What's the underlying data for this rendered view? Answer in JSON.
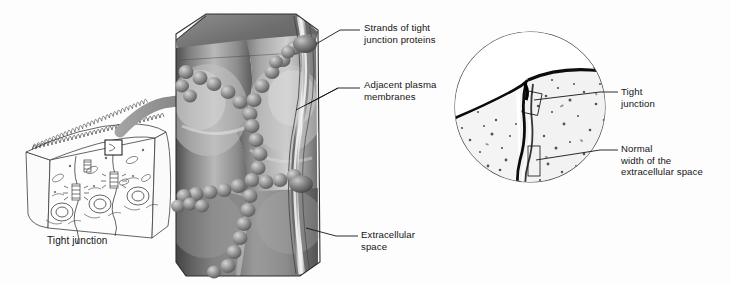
{
  "figure": {
    "background_color": "#fdfdfd",
    "ink_color": "#141414"
  },
  "panels": {
    "left_drawing": {
      "name": "epithelial-cell-line-drawing",
      "caption": "Tight junction",
      "cell_count": 3,
      "has_microvilli": true,
      "inset_box": true
    },
    "center_illustration": {
      "name": "tight-junction-3d-illustration",
      "style": "grayscale airbrush rendering",
      "strand_bead_rows": 4,
      "shade_light": "#d8d8d8",
      "shade_mid": "#9a9a9a",
      "shade_dark": "#4a4a4a"
    },
    "right_micrograph": {
      "name": "electron-micrograph",
      "shape": "circle",
      "grain": "stippled",
      "border_color": "#555555"
    }
  },
  "arrow": {
    "name": "magnify-arrow",
    "color": "#8c8c8c",
    "direction": "left-to-right"
  },
  "labels": {
    "tight_junction_left": "Tight junction",
    "strands_of_tight_junction_proteins": "Strands of tight\njunction proteins",
    "adjacent_plasma_membranes": "Adjacent plasma\nmembranes",
    "extracellular_space": "Extracellular\nspace",
    "tight_junction_micrograph": "Tight\njunction",
    "normal_width_extracellular_space": "Normal\nwidth of the\nextracellular space"
  }
}
